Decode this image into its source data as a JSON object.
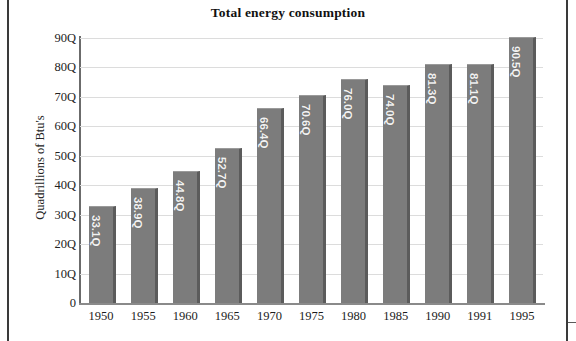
{
  "chart_data": {
    "type": "bar",
    "title": "Total energy consumption",
    "xlabel": "",
    "ylabel": "Quadrillions of Btu's",
    "categories": [
      "1950",
      "1955",
      "1960",
      "1965",
      "1970",
      "1975",
      "1980",
      "1985",
      "1990",
      "1991",
      "1995"
    ],
    "values": [
      33.1,
      38.9,
      44.8,
      52.7,
      66.4,
      70.6,
      76.0,
      74.0,
      81.3,
      81.1,
      90.5
    ],
    "value_labels": [
      "33.1Q",
      "38.9Q",
      "44.8Q",
      "52.7Q",
      "66.4Q",
      "70.6Q",
      "76.0Q",
      "74.0Q",
      "81.3Q",
      "81.1Q",
      "90.5Q"
    ],
    "ylim": [
      0,
      90
    ],
    "y_ticks": [
      0,
      10,
      20,
      30,
      40,
      50,
      60,
      70,
      80,
      90
    ],
    "y_tick_labels": [
      "0",
      "10Q",
      "20Q",
      "30Q",
      "40Q",
      "50Q",
      "60Q",
      "70Q",
      "80Q",
      "90Q"
    ],
    "grid": true,
    "grid_axis": "y",
    "legend": false,
    "legend_position": "none",
    "bar_color": "#7c7c7c",
    "bar_shadow_color": "#5b5b5b",
    "value_label_color": "#f2f2f2",
    "grid_color": "#dcdcdc",
    "axis_color": "#6b6b6b",
    "background_color": "#ffffff",
    "title_color": "#111111",
    "value_label_orientation": "vertical"
  }
}
